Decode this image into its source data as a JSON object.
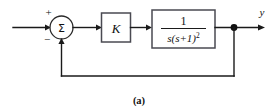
{
  "figure": {
    "caption": "(a)",
    "type": "closed-loop-block-diagram"
  },
  "summing_junction": {
    "symbol": "Σ",
    "plus_sign": "+",
    "minus_sign": "−",
    "name": "summing-junction"
  },
  "gain_block": {
    "label": "K"
  },
  "plant_block": {
    "numerator": "1",
    "denominator_base": "s(s+1)",
    "denominator_exponent": "2",
    "transfer_function": "1/(s(s+1)^2)"
  },
  "signals": {
    "output_label": "y",
    "input_label": "",
    "feedback_label": ""
  },
  "colors": {
    "wire": "#1a1a1a",
    "block_border": "#4a4a52",
    "background": "#ffffff",
    "text": "#111111"
  }
}
